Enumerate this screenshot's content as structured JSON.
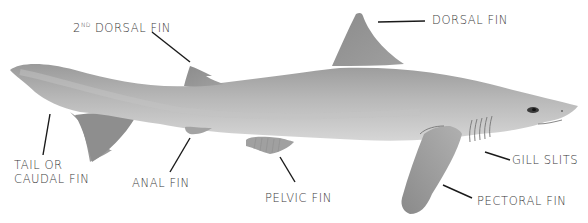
{
  "diagram": {
    "top_clipped_text": "...",
    "labels": {
      "second_dorsal_fin": {
        "sup": "ND",
        "pre": "2",
        "text": "DORSAL FIN"
      },
      "dorsal_fin": {
        "text": "DORSAL FIN"
      },
      "tail_line1": {
        "text": "TAIL OR"
      },
      "tail_line2": {
        "text": "CAUDAL FIN"
      },
      "anal_fin": {
        "text": "ANAL FIN"
      },
      "pelvic_fin": {
        "text": "PELVIC FIN"
      },
      "gill_slits": {
        "text": "GILL SLITS"
      },
      "pectoral_fin": {
        "text": "PECTORAL FIN"
      }
    },
    "colors": {
      "background": "#ffffff",
      "label_text": "#3a3a3a",
      "leader_line": "#1a1a1a",
      "body_light": "#c9c9c9",
      "body_mid": "#a9a9a9",
      "body_dark": "#8a8a8a",
      "fin": "#8f8f8f"
    }
  }
}
